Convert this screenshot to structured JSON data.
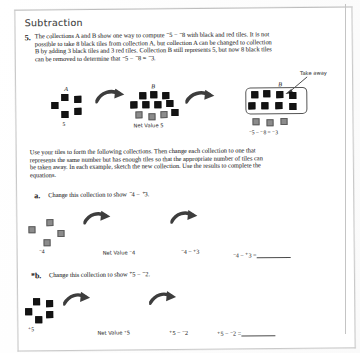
{
  "page": {
    "header": "Subtraction",
    "problem_number": "5."
  },
  "problem5": {
    "text_lines": [
      "The collections A and B show one way to compute ⁻5 − ⁻8 with black and red tiles. It is not",
      "possible to take 8 black tiles from collection A, but collection A can be changed to collection",
      "B by adding 3 black tiles and 3 red tiles. Collection B still represents 5, but now 8 black tiles",
      "can be removed to determine that ⁻5 − ⁻8 = ⁻3."
    ]
  },
  "figure_main": {
    "collection_a": {
      "label": "A",
      "value_label": "5",
      "black_tiles": 5,
      "red_tiles": 0
    },
    "collection_b": {
      "label": "B",
      "value_label": "Net Value 5",
      "black_tiles": 8,
      "red_tiles": 3
    },
    "collection_b_takeaway": {
      "label": "B",
      "annotation": "Take away",
      "equation": "⁻5 − ⁻8 = ⁻3",
      "black_tiles": 8,
      "red_tiles": 3
    }
  },
  "instructions": {
    "text_lines": [
      "Use your tiles to form the following collections. Then change each collection to one that",
      "represents the same number but has enough tiles so that the appropriate number of tiles can",
      "be taken away. In each example, sketch the new collection. Use the results to complete the",
      "equations."
    ]
  },
  "part_a": {
    "marker": "a.",
    "prompt": "Change this collection to show ⁻4 − ⁺3.",
    "collection": {
      "value_label": "⁻4",
      "red_tiles": 4,
      "black_tiles": 0
    },
    "net_value_label": "Net Value ⁻4",
    "middle_expression": "⁻4 − ⁺3",
    "answer_expression": "⁻4 − ⁺3 =",
    "answer_value": ""
  },
  "part_b": {
    "marker": "*b.",
    "prompt": "Change this collection to show ⁺5 − ⁻2.",
    "collection": {
      "value_label": "⁺5",
      "black_tiles": 5,
      "red_tiles": 0
    },
    "net_value_label": "Net Value ⁺5",
    "middle_expression": "⁺5 − ⁻2",
    "answer_expression": "⁺5 − ⁻2 =",
    "answer_value": ""
  },
  "colors": {
    "black_tile": "#141414",
    "red_tile": "#8c8c8c",
    "page_border": "#c9c9c9",
    "text": "#3a3a3a"
  }
}
